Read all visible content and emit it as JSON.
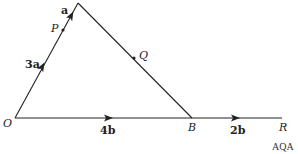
{
  "diagram": {
    "points": {
      "O": {
        "label": "O",
        "x": 15,
        "y": 118
      },
      "A": {
        "label": "",
        "x": 78,
        "y": 3
      },
      "P": {
        "label": "P",
        "x": 63,
        "y": 30
      },
      "Q": {
        "label": "Q",
        "x": 134,
        "y": 57
      },
      "B": {
        "label": "B",
        "x": 192,
        "y": 118
      },
      "R": {
        "label": "R",
        "x": 282,
        "y": 118
      }
    },
    "vectors": {
      "OP": "3a",
      "PA": "a",
      "OB": "4b",
      "BR": "2b"
    },
    "source": "AQA",
    "line_color": "#222222"
  }
}
